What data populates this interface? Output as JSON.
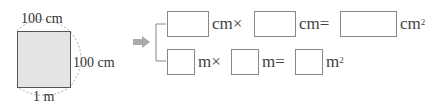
{
  "figure": {
    "top_label": "100 cm",
    "right_label": "100 cm",
    "bottom_label": "1 m",
    "square_fill": "#e4e4e4"
  },
  "arrow": {
    "icon": "arrow-right-icon",
    "color": "#aaaaaa"
  },
  "equations": {
    "row1": {
      "unit1": "cm",
      "op1": "×",
      "unit2": "cm",
      "op2": "=",
      "unit3": "cm",
      "exp": "2",
      "answers": [
        "",
        "",
        ""
      ]
    },
    "row2": {
      "unit1": "m",
      "op1": "×",
      "unit2": "m",
      "op2": "=",
      "unit3": "m",
      "exp": "2",
      "answers": [
        "",
        "",
        ""
      ]
    }
  }
}
